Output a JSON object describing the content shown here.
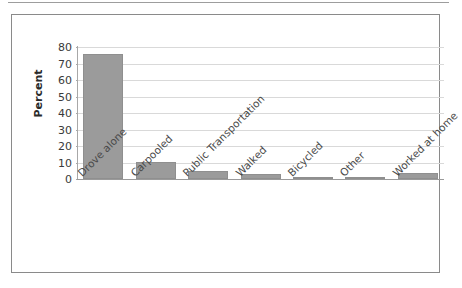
{
  "figure": {
    "frame_border_color": "#8a8a8a",
    "background": "#ffffff",
    "top_rule_color": "#9d9d9d"
  },
  "chart_data": {
    "type": "bar",
    "title": "",
    "subtitle": "",
    "xlabel": "",
    "ylabel": "Percent",
    "categories": [
      "Drove alone",
      "Carpooled",
      "Public Transportation",
      "Walked",
      "Bicycled",
      "Other",
      "Worked at home"
    ],
    "values": [
      75.5,
      10.2,
      5.1,
      2.8,
      0.7,
      1.2,
      3.6
    ],
    "ylim": [
      0,
      80
    ],
    "yticks": [
      0,
      10,
      20,
      30,
      40,
      50,
      60,
      70,
      80
    ],
    "ytick_labels": [
      "0",
      "10",
      "20",
      "30",
      "40",
      "50",
      "60",
      "70",
      "80"
    ],
    "grid": true,
    "grid_axis": "y",
    "legend": false,
    "legend_position": "none",
    "bar_color": "#9b9b9b",
    "bar_edge_color": "#8f8f8f",
    "gridline_color": "#d9d9d9",
    "axis_color": "#a8a8a8",
    "tick_label_color": "#3a3a3a",
    "category_label_rotation": -45
  }
}
